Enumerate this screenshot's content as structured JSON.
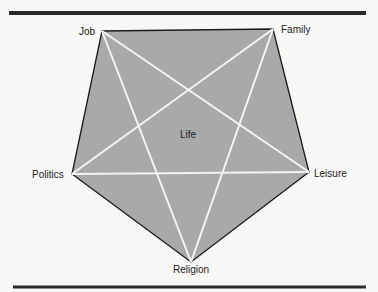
{
  "diagram": {
    "center_label": "Life",
    "colors": {
      "fill": "#a9a9a9",
      "star": "#f4f4f4",
      "edge": "#1a1a1a",
      "rule": "#2a2a2a",
      "text": "#222222"
    },
    "nodes": [
      {
        "id": "job",
        "label": "Job"
      },
      {
        "id": "family",
        "label": "Family"
      },
      {
        "id": "leisure",
        "label": "Leisure"
      },
      {
        "id": "religion",
        "label": "Religion"
      },
      {
        "id": "politics",
        "label": "Politics"
      }
    ]
  }
}
